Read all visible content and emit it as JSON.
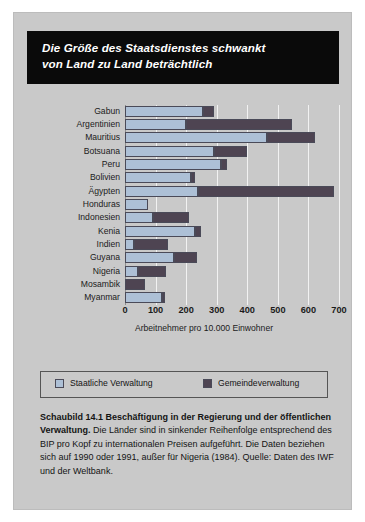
{
  "figure": {
    "title": "Die Größe des Staatsdienstes schwankt von Land zu Land beträchtlich",
    "title_line1": "Die Größe des Staatsdienstes schwankt",
    "title_line2": "von Land zu Land beträchtlich"
  },
  "legend": {
    "items": [
      {
        "label": "Staatliche Verwaltung",
        "color": "#adc0d6"
      },
      {
        "label": "Gemeindeverwaltung",
        "color": "#4e4452"
      }
    ]
  },
  "caption": {
    "bold_part": "Schaubild 14.1   Beschäftigung in der Regierung und der öffentlichen Verwaltung.",
    "rest": " Die Länder sind in sinkender Reihenfolge entsprechend des BIP pro Kopf zu internationalen Preisen aufgeführt. Die Daten beziehen sich auf 1990 oder 1991, außer für Nigeria (1984). Quelle: Daten des IWF und der Weltbank."
  },
  "chart_data": {
    "type": "bar",
    "orientation": "horizontal",
    "stacked": true,
    "title": "Die Größe des Staatsdienstes schwankt von Land zu Land beträchtlich",
    "xlabel": "Arbeitnehmer pro 10.000 Einwohner",
    "ylabel": "",
    "xlim": [
      0,
      700
    ],
    "xticks": [
      0,
      100,
      200,
      300,
      400,
      500,
      600,
      700
    ],
    "xtick_labels": [
      "0",
      "100",
      "200",
      "300",
      "400",
      "500",
      "600",
      "700"
    ],
    "grid": "vertical",
    "legend_position": "below-plot",
    "categories": [
      "Gabun",
      "Argentinien",
      "Mauritius",
      "Botsuana",
      "Peru",
      "Bolivien",
      "Ägypten",
      "Honduras",
      "Indonesien",
      "Kenia",
      "Indien",
      "Guyana",
      "Nigeria",
      "Mosambik",
      "Myanmar"
    ],
    "series": [
      {
        "name": "Staatliche Verwaltung",
        "color": "#adc0d6",
        "values": [
          255,
          200,
          465,
          290,
          315,
          215,
          240,
          75,
          90,
          230,
          30,
          160,
          42,
          0,
          120
        ]
      },
      {
        "name": "Gemeindeverwaltung",
        "color": "#4e4452",
        "values": [
          35,
          345,
          155,
          110,
          20,
          15,
          445,
          0,
          120,
          20,
          110,
          75,
          93,
          65,
          12
        ]
      }
    ],
    "totals": [
      290,
      545,
      620,
      400,
      335,
      230,
      685,
      75,
      210,
      250,
      140,
      235,
      135,
      65,
      132
    ]
  }
}
